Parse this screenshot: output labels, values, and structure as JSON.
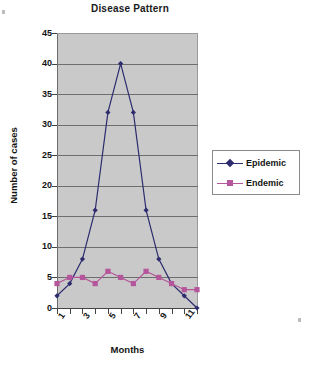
{
  "chart_data": {
    "type": "line",
    "title": "Disease Pattern",
    "xlabel": "Months",
    "ylabel": "Number of cases",
    "x": [
      1,
      2,
      3,
      4,
      5,
      6,
      7,
      8,
      9,
      10,
      11,
      12
    ],
    "categories": [
      "1",
      "2",
      "3",
      "4",
      "5",
      "6",
      "7",
      "8",
      "9",
      "10",
      "11",
      "12"
    ],
    "xtick_labels": [
      "1",
      "3",
      "5",
      "7",
      "9",
      "11"
    ],
    "xtick_positions": [
      1,
      3,
      5,
      7,
      9,
      11
    ],
    "ytick_labels": [
      "0",
      "5",
      "10",
      "15",
      "20",
      "25",
      "30",
      "35",
      "40",
      "45"
    ],
    "ytick_values": [
      0,
      5,
      10,
      15,
      20,
      25,
      30,
      35,
      40,
      45
    ],
    "ylim": [
      0,
      45
    ],
    "xlim": [
      1,
      12
    ],
    "grid": "horizontal",
    "plot_background": "#c9c9c9",
    "legend_position": "right",
    "series": [
      {
        "name": "Epidemic",
        "color": "#2c2c6e",
        "marker": "diamond",
        "values": [
          2,
          4,
          8,
          16,
          32,
          40,
          32,
          16,
          8,
          4,
          2,
          0
        ]
      },
      {
        "name": "Endemic",
        "color": "#b5559b",
        "marker": "square",
        "values": [
          4,
          5,
          5,
          4,
          6,
          5,
          4,
          6,
          5,
          4,
          3,
          3
        ]
      }
    ]
  },
  "legend": {
    "items": [
      {
        "label": "Epidemic"
      },
      {
        "label": "Endemic"
      }
    ]
  }
}
